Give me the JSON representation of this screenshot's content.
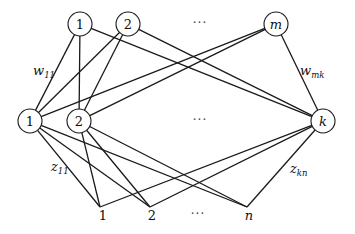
{
  "diagram": {
    "type": "three-layer network",
    "top_layer": [
      {
        "id": "t1",
        "label": "1",
        "x": 80,
        "y": 24
      },
      {
        "id": "t2",
        "label": "2",
        "x": 128,
        "y": 24
      },
      {
        "id": "tm",
        "label": "m",
        "x": 276,
        "y": 24,
        "italic": true
      }
    ],
    "top_ellipsis": {
      "text": "···",
      "x": 200,
      "y": 27
    },
    "middle_layer": [
      {
        "id": "h1",
        "label": "1",
        "x": 30,
        "y": 121
      },
      {
        "id": "h2",
        "label": "2",
        "x": 79,
        "y": 121
      },
      {
        "id": "hk",
        "label": "k",
        "x": 323,
        "y": 121,
        "italic": true
      }
    ],
    "middle_ellipsis": {
      "text": "···",
      "x": 200,
      "y": 124
    },
    "bottom_layer": [
      {
        "id": "b1",
        "label": "1",
        "x": 103,
        "y": 216,
        "ax": 100,
        "ay": 207
      },
      {
        "id": "b2",
        "label": "2",
        "x": 152,
        "y": 216,
        "ax": 150,
        "ay": 207
      },
      {
        "id": "bn",
        "label": "n",
        "x": 249,
        "y": 216,
        "italic": true,
        "ax": 247,
        "ay": 207
      }
    ],
    "bottom_ellipsis": {
      "text": "···",
      "x": 198,
      "y": 218
    },
    "weight_labels": [
      {
        "base": "w",
        "sub": "11",
        "x": 33,
        "y": 75
      },
      {
        "base": "w",
        "sub": "mk",
        "x": 300,
        "y": 75
      },
      {
        "base": "z",
        "sub": "11",
        "x": 51,
        "y": 171
      },
      {
        "base": "z",
        "sub": "kn",
        "x": 290,
        "y": 173
      }
    ],
    "edges": [
      [
        "t1",
        "h1"
      ],
      [
        "t1",
        "h2"
      ],
      [
        "t1",
        "hk"
      ],
      [
        "t2",
        "h1"
      ],
      [
        "t2",
        "h2"
      ],
      [
        "t2",
        "hk"
      ],
      [
        "tm",
        "h1"
      ],
      [
        "tm",
        "h2"
      ],
      [
        "tm",
        "hk"
      ],
      [
        "h1",
        "b1"
      ],
      [
        "h1",
        "b2"
      ],
      [
        "h1",
        "bn"
      ],
      [
        "h2",
        "b1"
      ],
      [
        "h2",
        "b2"
      ],
      [
        "h2",
        "bn"
      ],
      [
        "hk",
        "b1"
      ],
      [
        "hk",
        "b2"
      ],
      [
        "hk",
        "bn"
      ]
    ],
    "node_radius": 12
  }
}
